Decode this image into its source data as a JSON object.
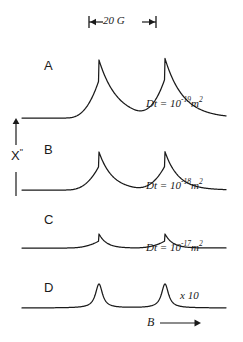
{
  "figure": {
    "scalebar": {
      "label": "20 G",
      "x_start": 89,
      "x_end": 156,
      "y": 22
    },
    "axes": {
      "y_label": "X",
      "y_label_sup": "\"",
      "x_label": "B",
      "x_arrow": "→"
    },
    "traces": [
      {
        "letter": "A",
        "letter_x": 44,
        "letter_y": 66,
        "annotation_prefix": "Dt = 10",
        "annotation_exp": "-19",
        "annotation_unit": "m",
        "annotation_unit_exp": "2",
        "annot_x": 146,
        "annot_y": 104,
        "baseline_y": 118,
        "amplitude_up": 58,
        "amplitude_down": 38,
        "decay": 0.055,
        "rise_w": 13,
        "peaks_x": [
          99,
          165
        ]
      },
      {
        "letter": "B",
        "letter_x": 44,
        "letter_y": 150,
        "annotation_prefix": "Dt = 10",
        "annotation_exp": "-18",
        "annotation_unit": "m",
        "annotation_unit_exp": "2",
        "annot_x": 146,
        "annot_y": 186,
        "baseline_y": 190,
        "amplitude_up": 38,
        "amplitude_down": 24,
        "decay": 0.075,
        "rise_w": 10,
        "peaks_x": [
          99,
          165
        ]
      },
      {
        "letter": "C",
        "letter_x": 44,
        "letter_y": 220,
        "annotation_prefix": "Dt = 10",
        "annotation_exp": "-17",
        "annotation_unit": "m",
        "annotation_unit_exp": "2",
        "annot_x": 146,
        "annot_y": 248,
        "baseline_y": 248,
        "amplitude_up": 14,
        "amplitude_down": 7,
        "decay": 0.13,
        "rise_w": 7,
        "peaks_x": [
          99,
          165
        ]
      },
      {
        "letter": "D",
        "letter_x": 44,
        "letter_y": 288,
        "annotation_prefix": "",
        "annotation_exp": "",
        "annotation_unit": "",
        "annotation_unit_exp": "",
        "annot_x": 0,
        "annot_y": 0,
        "baseline_y": 308,
        "amplitude_up": 24,
        "amplitude_down": 0,
        "decay": 0,
        "rise_w": 0,
        "peaks_x": [
          99,
          165
        ]
      }
    ],
    "gain_note": {
      "text": "x 10",
      "x": 180,
      "y": 296
    },
    "plot_x_start": 22,
    "plot_x_end": 226,
    "colors": {
      "ink": "#1a1a1a",
      "paper": "#ffffff"
    }
  }
}
